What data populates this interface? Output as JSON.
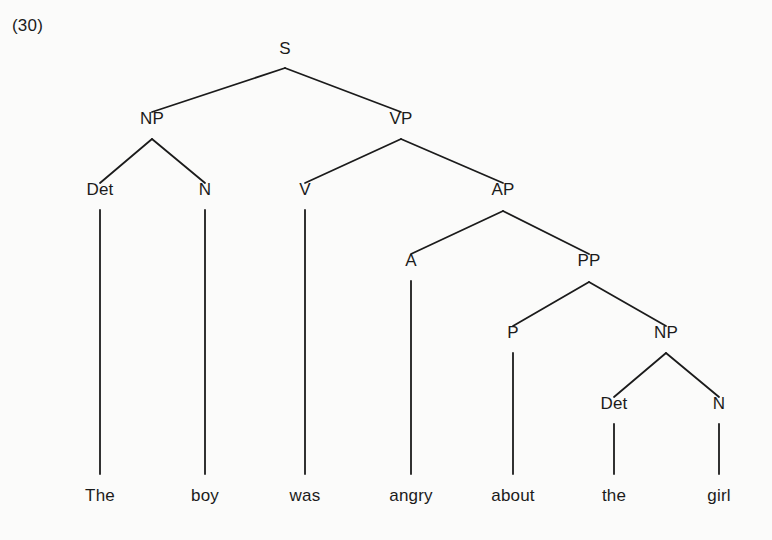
{
  "figure": {
    "example_number": "(30)",
    "caption": "",
    "background_color": "#fbfbfa",
    "line_color": "#1b1b1b",
    "text_color": "#1b1b1b"
  },
  "tree": {
    "type": "constituency-syntax-tree",
    "sentence": "The boy was angry about the girl",
    "nodes": [
      {
        "id": "S",
        "label": "S",
        "x": 285,
        "y": 57,
        "kind": "nonterminal"
      },
      {
        "id": "NP1",
        "label": "NP",
        "x": 152,
        "y": 127,
        "kind": "nonterminal"
      },
      {
        "id": "VP",
        "label": "VP",
        "x": 401,
        "y": 127,
        "kind": "nonterminal"
      },
      {
        "id": "Det1",
        "label": "Det",
        "x": 100,
        "y": 198,
        "kind": "preterminal"
      },
      {
        "id": "N1",
        "label": "N",
        "x": 205,
        "y": 198,
        "kind": "preterminal"
      },
      {
        "id": "V",
        "label": "V",
        "x": 305,
        "y": 198,
        "kind": "preterminal"
      },
      {
        "id": "AP",
        "label": "AP",
        "x": 503,
        "y": 198,
        "kind": "nonterminal"
      },
      {
        "id": "A",
        "label": "A",
        "x": 411,
        "y": 269,
        "kind": "preterminal"
      },
      {
        "id": "PP",
        "label": "PP",
        "x": 589,
        "y": 269,
        "kind": "nonterminal"
      },
      {
        "id": "P",
        "label": "P",
        "x": 513,
        "y": 341,
        "kind": "preterminal"
      },
      {
        "id": "NP2",
        "label": "NP",
        "x": 666,
        "y": 341,
        "kind": "nonterminal"
      },
      {
        "id": "Det2",
        "label": "Det",
        "x": 614,
        "y": 412,
        "kind": "preterminal"
      },
      {
        "id": "N2",
        "label": "N",
        "x": 719,
        "y": 412,
        "kind": "preterminal"
      }
    ],
    "leaves": [
      {
        "id": "w1",
        "label": "The",
        "x": 100,
        "y": 487,
        "parent": "Det1"
      },
      {
        "id": "w2",
        "label": "boy",
        "x": 205,
        "y": 487,
        "parent": "N1"
      },
      {
        "id": "w3",
        "label": "was",
        "x": 305,
        "y": 487,
        "parent": "V"
      },
      {
        "id": "w4",
        "label": "angry",
        "x": 411,
        "y": 487,
        "parent": "A"
      },
      {
        "id": "w5",
        "label": "about",
        "x": 513,
        "y": 487,
        "parent": "P"
      },
      {
        "id": "w6",
        "label": "the",
        "x": 614,
        "y": 487,
        "parent": "Det2"
      },
      {
        "id": "w7",
        "label": "girl",
        "x": 719,
        "y": 487,
        "parent": "N2"
      }
    ],
    "edges": [
      {
        "from": "S",
        "to": "NP1",
        "x1": 285,
        "y1": 68,
        "x2": 152,
        "y2": 112
      },
      {
        "from": "S",
        "to": "VP",
        "x1": 285,
        "y1": 68,
        "x2": 401,
        "y2": 112
      },
      {
        "from": "NP1",
        "to": "Det1",
        "x1": 152,
        "y1": 139,
        "x2": 100,
        "y2": 183
      },
      {
        "from": "NP1",
        "to": "N1",
        "x1": 152,
        "y1": 139,
        "x2": 205,
        "y2": 183
      },
      {
        "from": "VP",
        "to": "V",
        "x1": 401,
        "y1": 139,
        "x2": 305,
        "y2": 183
      },
      {
        "from": "VP",
        "to": "AP",
        "x1": 401,
        "y1": 139,
        "x2": 503,
        "y2": 183
      },
      {
        "from": "AP",
        "to": "A",
        "x1": 503,
        "y1": 211,
        "x2": 411,
        "y2": 254
      },
      {
        "from": "AP",
        "to": "PP",
        "x1": 503,
        "y1": 211,
        "x2": 589,
        "y2": 254
      },
      {
        "from": "PP",
        "to": "P",
        "x1": 589,
        "y1": 282,
        "x2": 513,
        "y2": 326
      },
      {
        "from": "PP",
        "to": "NP2",
        "x1": 589,
        "y1": 282,
        "x2": 666,
        "y2": 326
      },
      {
        "from": "NP2",
        "to": "Det2",
        "x1": 666,
        "y1": 353,
        "x2": 614,
        "y2": 397
      },
      {
        "from": "NP2",
        "to": "N2",
        "x1": 666,
        "y1": 353,
        "x2": 719,
        "y2": 397
      },
      {
        "from": "Det1",
        "to": "w1",
        "x1": 100,
        "y1": 210,
        "x2": 100,
        "y2": 474
      },
      {
        "from": "N1",
        "to": "w2",
        "x1": 205,
        "y1": 210,
        "x2": 205,
        "y2": 474
      },
      {
        "from": "V",
        "to": "w3",
        "x1": 305,
        "y1": 210,
        "x2": 305,
        "y2": 474
      },
      {
        "from": "A",
        "to": "w4",
        "x1": 411,
        "y1": 281,
        "x2": 411,
        "y2": 474
      },
      {
        "from": "P",
        "to": "w5",
        "x1": 513,
        "y1": 353,
        "x2": 513,
        "y2": 474
      },
      {
        "from": "Det2",
        "to": "w6",
        "x1": 614,
        "y1": 424,
        "x2": 614,
        "y2": 474
      },
      {
        "from": "N2",
        "to": "w7",
        "x1": 719,
        "y1": 424,
        "x2": 719,
        "y2": 474
      }
    ]
  }
}
